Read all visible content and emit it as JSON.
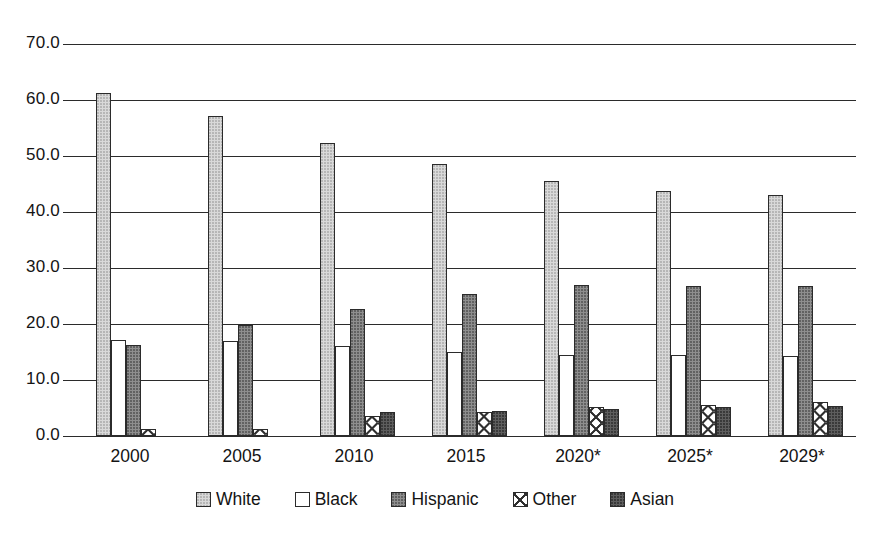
{
  "chart_data": {
    "type": "bar",
    "title": "",
    "subtitle": "",
    "xlabel": "",
    "ylabel": "",
    "ylim": [
      0,
      70
    ],
    "ytick_step": 10,
    "ytick_labels": [
      "0.0",
      "10.0",
      "20.0",
      "30.0",
      "40.0",
      "50.0",
      "60.0",
      "70.0"
    ],
    "grid": true,
    "grid_axis": "y",
    "legend_position": "bottom",
    "categories": [
      "2000",
      "2005",
      "2010",
      "2015",
      "2020*",
      "2025*",
      "2029*"
    ],
    "series": [
      {
        "name": "White",
        "pattern": "light-gray-stipple",
        "color": "#d9d9d9",
        "values": [
          61.2,
          57.1,
          52.3,
          48.6,
          45.5,
          43.8,
          43.0
        ]
      },
      {
        "name": "Black",
        "pattern": "horizontal-dashes",
        "color": "#ffffff",
        "values": [
          17.1,
          17.0,
          16.0,
          15.0,
          14.5,
          14.4,
          14.3
        ]
      },
      {
        "name": "Hispanic",
        "pattern": "medium-gray-stipple",
        "color": "#8e8e8e",
        "values": [
          16.3,
          19.8,
          22.7,
          25.3,
          27.0,
          26.8,
          26.7
        ]
      },
      {
        "name": "Other",
        "pattern": "x-crosshatch",
        "color": "#ffffff",
        "values": [
          1.3,
          1.2,
          3.5,
          4.2,
          5.2,
          5.6,
          6.0
        ]
      },
      {
        "name": "Asian",
        "pattern": "dark-gray-stipple",
        "color": "#5e5e5e",
        "values": [
          0.0,
          0.0,
          4.2,
          4.5,
          4.8,
          5.2,
          5.4
        ]
      }
    ]
  },
  "legend": {
    "items": [
      {
        "label": "White"
      },
      {
        "label": "Black"
      },
      {
        "label": "Hispanic"
      },
      {
        "label": "Other"
      },
      {
        "label": "Asian"
      }
    ]
  }
}
